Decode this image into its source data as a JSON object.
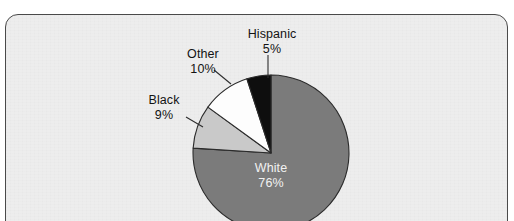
{
  "caption_remnant": "",
  "frame": {
    "name": "chart-panel",
    "background_color": "#ededed",
    "border_color": "#4a4a4a"
  },
  "chart_data": {
    "type": "pie",
    "title": "",
    "subtitle": "",
    "xlabel": "",
    "ylabel": "",
    "legend_position": "callout-labels",
    "grid": false,
    "start_angle_deg": 0,
    "direction": "clockwise",
    "categories": [
      "White",
      "Black",
      "Other",
      "Hispanic"
    ],
    "values": [
      76,
      9,
      10,
      5
    ],
    "value_suffix": "%",
    "slices": [
      {
        "label": "White",
        "value": 76,
        "value_text": "76%",
        "color": "#7b7b7b",
        "label_placement": "inside",
        "text_color": "#f2f2f2"
      },
      {
        "label": "Black",
        "value": 9,
        "value_text": "9%",
        "color": "#c9c9c9",
        "label_placement": "callout",
        "text_color": "#131313"
      },
      {
        "label": "Other",
        "value": 10,
        "value_text": "10%",
        "color": "#fdfdfd",
        "label_placement": "callout",
        "text_color": "#131313"
      },
      {
        "label": "Hispanic",
        "value": 5,
        "value_text": "5%",
        "color": "#0e0e0e",
        "label_placement": "callout",
        "text_color": "#131313"
      }
    ]
  }
}
